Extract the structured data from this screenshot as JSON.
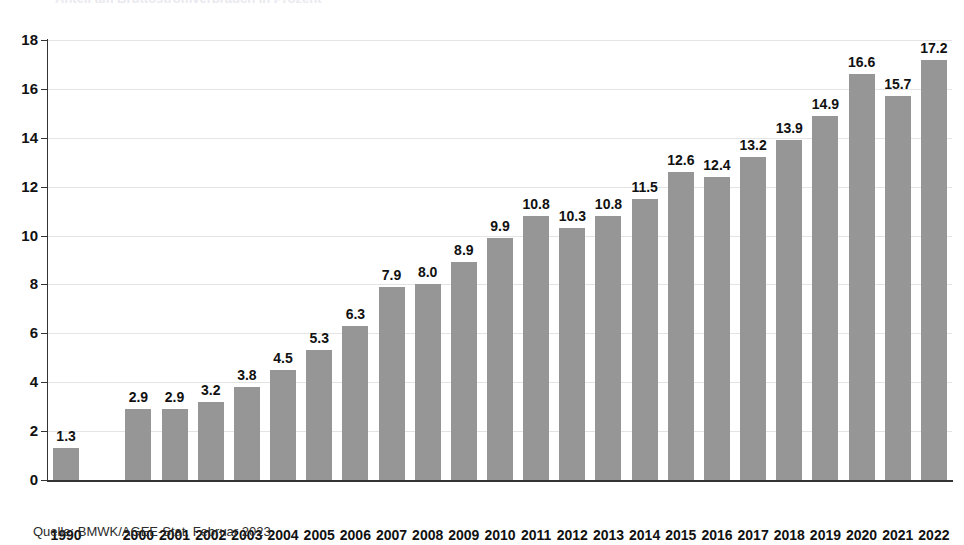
{
  "title_remnant": "Anteil am Bruttostromverbrauch in Prozent",
  "source": {
    "text": "Quelle: BMWK/AGEE-Stat, Februar 2023"
  },
  "chart_data": {
    "type": "bar",
    "title": "",
    "xlabel": "",
    "ylabel": "",
    "ylim": [
      0,
      18
    ],
    "yticks": [
      0,
      2,
      4,
      6,
      8,
      10,
      12,
      14,
      16,
      18
    ],
    "ytick_labels": [
      "0",
      "2",
      "4",
      "6",
      "8",
      "10",
      "12",
      "14",
      "16",
      "18"
    ],
    "grid": true,
    "legend": "none",
    "bar_color": "#969696",
    "categories": [
      "1990",
      "",
      "2000",
      "2001",
      "2002",
      "2003",
      "2004",
      "2005",
      "2006",
      "2007",
      "2008",
      "2009",
      "2010",
      "2011",
      "2012",
      "2013",
      "2014",
      "2015",
      "2016",
      "2017",
      "2018",
      "2019",
      "2020",
      "2021",
      "2022"
    ],
    "values": [
      1.3,
      null,
      2.9,
      2.9,
      3.2,
      3.8,
      4.5,
      5.3,
      6.3,
      7.9,
      8.0,
      8.9,
      9.9,
      10.8,
      10.3,
      10.8,
      11.5,
      12.6,
      12.4,
      13.2,
      13.9,
      14.9,
      16.6,
      15.7,
      17.2
    ],
    "value_labels": [
      "1.3",
      "",
      "2.9",
      "2.9",
      "3.2",
      "3.8",
      "4.5",
      "5.3",
      "6.3",
      "7.9",
      "8.0",
      "8.9",
      "9.9",
      "10.8",
      "10.3",
      "10.8",
      "11.5",
      "12.6",
      "12.4",
      "13.2",
      "13.9",
      "14.9",
      "16.6",
      "15.7",
      "17.2"
    ]
  }
}
